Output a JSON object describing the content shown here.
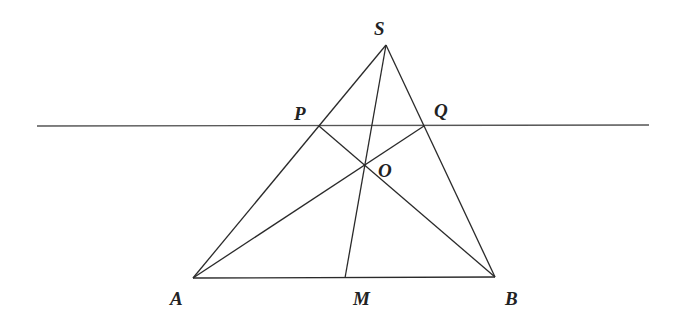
{
  "diagram": {
    "type": "geometry",
    "points": {
      "S": {
        "label": "S",
        "x": 386,
        "y": 45
      },
      "P": {
        "label": "P",
        "x": 319,
        "y": 126
      },
      "Q": {
        "label": "Q",
        "x": 424,
        "y": 126
      },
      "O": {
        "label": "O",
        "x": 364,
        "y": 166
      },
      "A": {
        "label": "A",
        "x": 193,
        "y": 278
      },
      "M": {
        "label": "M",
        "x": 345,
        "y": 278
      },
      "B": {
        "label": "B",
        "x": 495,
        "y": 277
      }
    },
    "line": {
      "x1": 37,
      "y1": 126,
      "x2": 649,
      "y2": 125
    },
    "segments": [
      "SA",
      "SB",
      "AB",
      "SM",
      "AQ",
      "BP"
    ],
    "colors": {
      "stroke": "#2a2a2a",
      "line": "#555555",
      "label": "#222222"
    }
  }
}
